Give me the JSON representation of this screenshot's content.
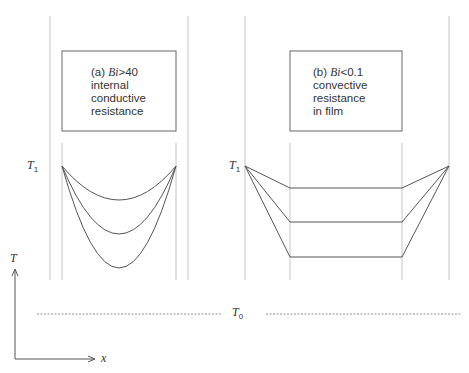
{
  "panels": [
    {
      "id": "a",
      "label_prefix": "(a)",
      "condition_var": "Bi",
      "condition_op": ">",
      "condition_value": "40",
      "line2": "internal",
      "line3": "conductive",
      "line4": "resistance",
      "boundary_temperature": "T",
      "boundary_subscript": "1",
      "profile_shape": "parabolic"
    },
    {
      "id": "b",
      "label_prefix": "(b)",
      "condition_var": "Bi",
      "condition_op": "<",
      "condition_value": "0.1",
      "line2": "convective",
      "line3": "resistance",
      "line4": "in film",
      "boundary_temperature": "T",
      "boundary_subscript": "1",
      "profile_shape": "flat-with-film-drop"
    }
  ],
  "axes": {
    "y_label": "T",
    "x_label": "x"
  },
  "reference": {
    "label": "T",
    "subscript": "0",
    "style": "dashed"
  },
  "colors": {
    "line": "#555555",
    "guide": "#bbbbbb",
    "text": "#333333"
  }
}
